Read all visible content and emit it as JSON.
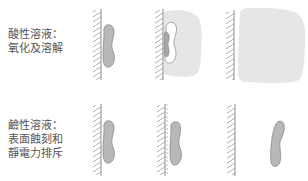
{
  "diagram": {
    "rows": [
      {
        "id": "acidic",
        "label_lines": [
          "酸性溶液：",
          "氧化及溶解"
        ],
        "stages": [
          "particle-on-wall",
          "particle-oxidizing-with-cloud",
          "fully-dissolved-cloud"
        ]
      },
      {
        "id": "alkaline",
        "label_lines": [
          "鹼性溶液：",
          "表面蝕刻和",
          "靜電力排斥"
        ],
        "stages": [
          "particle-on-wall",
          "particle-etched-surface",
          "particle-repelled-from-wall"
        ]
      }
    ],
    "colors": {
      "particle_fill": "#b8b8b8",
      "particle_stroke": "#8a8a8a",
      "cloud_fill": "#e6e6e6",
      "wall": "#8c8c8c",
      "text": "#555555"
    }
  }
}
